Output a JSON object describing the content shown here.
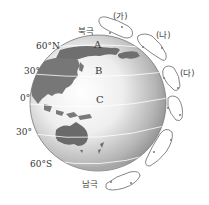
{
  "poles": {
    "north": "북극",
    "south": "남극"
  },
  "latitudes": {
    "n60": "60°N",
    "n30": "30°",
    "eq": "0°",
    "s30": "30°",
    "s60": "60°S"
  },
  "regions": {
    "a": "A",
    "b": "B",
    "c": "C"
  },
  "cells": [
    {
      "id": "ga",
      "label": "(가)",
      "hemisphere": "north",
      "band": "60°N-90°N"
    },
    {
      "id": "na",
      "label": "(나)",
      "hemisphere": "north",
      "band": "30°N-60°N"
    },
    {
      "id": "da",
      "label": "(다)",
      "hemisphere": "north",
      "band": "0°-30°N"
    },
    {
      "id": "s1",
      "label": "",
      "hemisphere": "south",
      "band": "0°-30°S"
    },
    {
      "id": "s2",
      "label": "",
      "hemisphere": "south",
      "band": "30°S-60°S"
    },
    {
      "id": "s3",
      "label": "",
      "hemisphere": "south",
      "band": "60°S-90°S"
    }
  ],
  "colors": {
    "globe_light": "#f4f4f4",
    "globe_dark": "#8a8a8a",
    "land": "#6e6e6e",
    "loop_stroke": "#777777"
  }
}
